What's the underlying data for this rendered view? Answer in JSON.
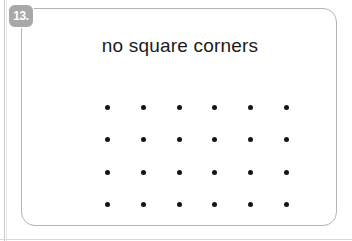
{
  "worksheet": {
    "badge": {
      "label": "13.",
      "icon": "number-badge",
      "background_color": "#a8a8a8",
      "text_color": "#ffffff"
    },
    "title": "no square corners",
    "card": {
      "border_color": "#b4b4b4",
      "background_color": "#ffffff",
      "corner_style": "rounded"
    },
    "dot_grid": {
      "rows": 4,
      "columns": 6,
      "total_dots": 24,
      "dot_color": "#151515",
      "row_labels": [
        "row-1",
        "row-2",
        "row-3",
        "row-4"
      ],
      "grid": [
        [
          "dot",
          "dot",
          "dot",
          "dot",
          "dot",
          "dot"
        ],
        [
          "dot",
          "dot",
          "dot",
          "dot",
          "dot",
          "dot"
        ],
        [
          "dot",
          "dot",
          "dot",
          "dot",
          "dot",
          "dot"
        ],
        [
          "dot",
          "dot",
          "dot",
          "dot",
          "dot",
          "dot"
        ]
      ]
    }
  }
}
